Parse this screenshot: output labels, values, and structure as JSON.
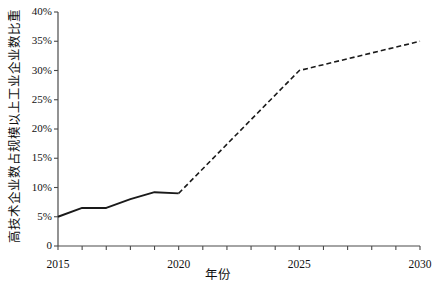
{
  "chart_data": {
    "type": "line",
    "title": "",
    "xlabel": "年份",
    "ylabel": "高技术企业数占规模以上工业企业数比重",
    "xlim": [
      2015,
      2030
    ],
    "ylim": [
      0,
      40
    ],
    "grid": false,
    "legend": "none",
    "x_tick_labels": [
      "2015",
      "2020",
      "2025",
      "2030"
    ],
    "x_tick_values": [
      2015,
      2020,
      2025,
      2030
    ],
    "x_minor_ticks": [
      2016,
      2017,
      2018,
      2019,
      2021,
      2022,
      2023,
      2024,
      2026,
      2027,
      2028,
      2029
    ],
    "y_tick_labels": [
      "0",
      "5%",
      "10%",
      "15%",
      "20%",
      "25%",
      "30%",
      "35%",
      "40%"
    ],
    "y_tick_values": [
      0,
      5,
      10,
      15,
      20,
      25,
      30,
      35,
      40
    ],
    "series": [
      {
        "name": "历史值",
        "style": "solid",
        "color": "#1a1a1a",
        "x": [
          2015,
          2016,
          2017,
          2018,
          2019,
          2020
        ],
        "values": [
          5.0,
          6.5,
          6.5,
          8.0,
          9.2,
          9.0
        ]
      },
      {
        "name": "预测值",
        "style": "dashed",
        "color": "#1a1a1a",
        "x": [
          2020,
          2025,
          2030
        ],
        "values": [
          9.0,
          30.0,
          35.0
        ]
      }
    ]
  },
  "axes": {
    "line_color": "#4a4a4a",
    "tick_color": "#4a4a4a",
    "background": "#ffffff"
  }
}
